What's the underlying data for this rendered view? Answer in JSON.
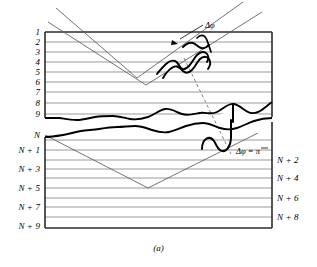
{
  "figure": {
    "caption": "(a)",
    "title_alt": "Crystal lattice planes with beam reflection and phase shift"
  },
  "annotations": [
    {
      "text": "Δφ",
      "x": 205,
      "y": 21
    },
    {
      "text": "Δφ = π",
      "x": 236,
      "y": 147
    }
  ],
  "labels": {
    "upper_left": [
      {
        "text": "1",
        "y": 32
      },
      {
        "text": "2",
        "y": 42
      },
      {
        "text": "3",
        "y": 52
      },
      {
        "text": "4",
        "y": 62
      },
      {
        "text": "5",
        "y": 72
      },
      {
        "text": "6",
        "y": 82
      },
      {
        "text": "7",
        "y": 92
      },
      {
        "text": "8",
        "y": 103
      },
      {
        "text": "9",
        "y": 114
      }
    ],
    "lower_left": [
      {
        "text": "N",
        "y": 135
      },
      {
        "text": "N + 1",
        "y": 150
      },
      {
        "text": "N + 3",
        "y": 169
      },
      {
        "text": "N + 5",
        "y": 188
      },
      {
        "text": "N + 7",
        "y": 207
      },
      {
        "text": "N + 9",
        "y": 226
      }
    ],
    "lower_right": [
      {
        "text": "N + 2",
        "y": 160
      },
      {
        "text": "N + 4",
        "y": 178
      },
      {
        "text": "N + 6",
        "y": 198
      },
      {
        "text": "N + 8",
        "y": 217
      }
    ]
  },
  "geometry": {
    "slab": {
      "left": 45,
      "right": 272,
      "top": 32,
      "bottom": 228
    },
    "lattice_line_color": "#8f8f8f",
    "border_color": "#2b2b2b",
    "ray_color": "#5a5a5a",
    "thick_curve_color": "#000000"
  }
}
